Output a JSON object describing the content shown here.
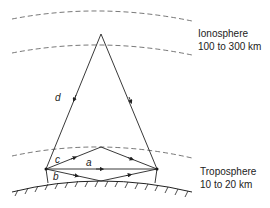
{
  "layers": {
    "ionosphere": {
      "name": "Ionosphere",
      "range": "100 to 300 km"
    },
    "troposphere": {
      "name": "Troposphere",
      "range": "10 to 20 km"
    }
  },
  "paths": {
    "a": "a",
    "b": "b",
    "c": "c",
    "d": "d"
  },
  "colors": {
    "line": "#333333",
    "dash": "#555555"
  }
}
